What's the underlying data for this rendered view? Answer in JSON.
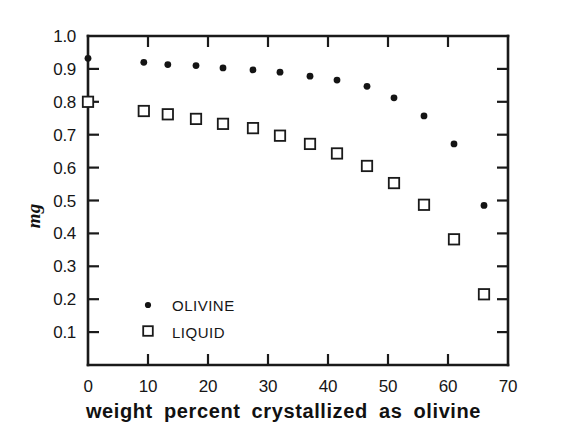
{
  "chart_data": {
    "type": "scatter",
    "title": "",
    "xlabel": "weight  percent  crystallized  as  olivine",
    "ylabel": "mg",
    "xlim": [
      0,
      70
    ],
    "ylim": [
      0,
      1.0
    ],
    "grid": false,
    "legend_position": "inside-lower-left",
    "xticks": [
      0,
      10,
      20,
      30,
      40,
      50,
      60,
      70
    ],
    "xticklabels": [
      "0",
      "10",
      "20",
      "30",
      "40",
      "50",
      "60",
      "70"
    ],
    "yticks": [
      0.1,
      0.2,
      0.3,
      0.4,
      0.5,
      0.6,
      0.7,
      0.8,
      0.9,
      1.0
    ],
    "yticklabels": [
      "0.1",
      "0.2",
      "0.3",
      "0.4",
      "0.5",
      "0.6",
      "0.7",
      "0.8",
      "0.9",
      "1.0"
    ],
    "series": [
      {
        "name": "OLIVINE",
        "marker": "filled-circle",
        "color": "#141414",
        "x": [
          0,
          9.3,
          13.3,
          18.0,
          22.5,
          27.5,
          32.0,
          37.0,
          41.5,
          46.5,
          51.0,
          56.0,
          61.0,
          66.0
        ],
        "y": [
          0.932,
          0.92,
          0.913,
          0.91,
          0.903,
          0.897,
          0.89,
          0.878,
          0.866,
          0.847,
          0.812,
          0.757,
          0.672,
          0.485
        ]
      },
      {
        "name": "LIQUID",
        "marker": "open-square",
        "color": "#ffffff",
        "x": [
          0,
          9.3,
          13.3,
          18.0,
          22.5,
          27.5,
          32.0,
          37.0,
          41.5,
          46.5,
          51.0,
          56.0,
          61.0,
          66.0
        ],
        "y": [
          0.8,
          0.772,
          0.762,
          0.748,
          0.733,
          0.72,
          0.697,
          0.672,
          0.643,
          0.605,
          0.553,
          0.487,
          0.382,
          0.215
        ]
      }
    ]
  },
  "legend": {
    "entries": [
      {
        "label": "OLIVINE",
        "marker": "filled-circle"
      },
      {
        "label": "LIQUID",
        "marker": "open-square"
      }
    ]
  },
  "axes": {
    "y_axis_label": "mg",
    "x_axis_label": "weight  percent  crystallized  as  olivine"
  }
}
